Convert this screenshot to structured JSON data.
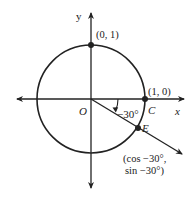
{
  "diagram": {
    "axes": {
      "x_label": "x",
      "y_label": "y"
    },
    "origin": {
      "label": "O"
    },
    "points": [
      {
        "id": "top",
        "label": "(0, 1)"
      },
      {
        "id": "C",
        "name": "C",
        "label": "(1, 0)"
      },
      {
        "id": "E",
        "name": "E",
        "label_line1": "(cos −30°,",
        "label_line2": "sin −30°)"
      }
    ],
    "angle": {
      "label": "−30°",
      "degrees": -30
    },
    "colors": {
      "stroke": "#222222",
      "background": "#ffffff"
    }
  }
}
